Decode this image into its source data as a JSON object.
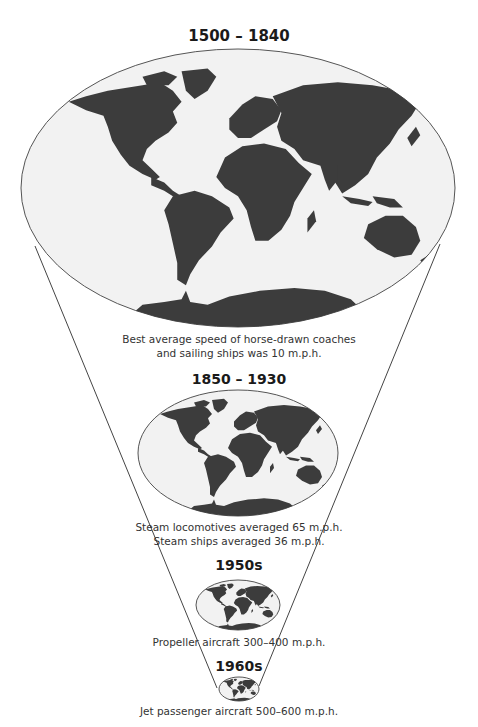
{
  "colors": {
    "land": "#3c3c3c",
    "ocean": "#f2f2f2",
    "outline": "#555555",
    "funnel_line": "#444444"
  },
  "eras": [
    {
      "title": "1500 – 1840",
      "caption_lines": [
        "Best average speed of horse-drawn coaches",
        "and sailing ships was 10 m.p.h."
      ]
    },
    {
      "title": "1850 – 1930",
      "caption_lines": [
        "Steam locomotives averaged 65 m.p.h.",
        "Steam ships averaged 36 m.p.h."
      ]
    },
    {
      "title": "1950s",
      "caption_lines": [
        "Propeller aircraft 300–400 m.p.h."
      ]
    },
    {
      "title": "1960s",
      "caption_lines": [
        "Jet passenger aircraft 500–600 m.p.h."
      ]
    }
  ]
}
